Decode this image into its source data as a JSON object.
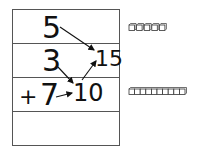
{
  "worksheet": {
    "problem": {
      "addends": [
        "5",
        "3",
        "7"
      ],
      "operator": "+",
      "partial_sum": "10",
      "total": "15"
    },
    "blocks": {
      "units": {
        "count": 5,
        "label": "ones cubes"
      },
      "rod": {
        "segments": 10,
        "label": "ten rod"
      }
    },
    "colors": {
      "ink": "#111111",
      "grid": "#555555",
      "block": "#333333"
    }
  }
}
